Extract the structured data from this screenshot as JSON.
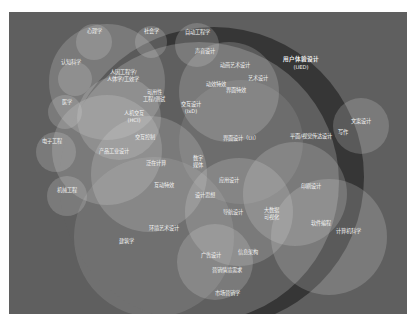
{
  "diagram": {
    "title": "",
    "type": "venn-bubble",
    "colors": {
      "background": "#5f5f5f",
      "page": "#ffffff",
      "bubble_fill": "#d9d9d9",
      "ring_dark": "#2f2f2f",
      "label": "#f2f2f2"
    },
    "ring": {
      "label_line1": "用户体验设计",
      "label_line2": "(UED)"
    },
    "bubbles": [
      {
        "id": "psychology",
        "label": "心理学"
      },
      {
        "id": "sociology",
        "label": "社会学"
      },
      {
        "id": "automation",
        "label": "自动工程学"
      },
      {
        "id": "cognitive",
        "label": "认知科学"
      },
      {
        "id": "ergonomics",
        "label": "人因工程学/人体学/工效学"
      },
      {
        "id": "medicine",
        "label": "医学"
      },
      {
        "id": "electronics",
        "label": "电子工程"
      },
      {
        "id": "industrial",
        "label": "产品工业设计"
      },
      {
        "id": "mechanical",
        "label": "机械工程"
      },
      {
        "id": "motion_art",
        "label": "动画艺术设计"
      },
      {
        "id": "copywriting",
        "label": "文案设计"
      },
      {
        "id": "architecture",
        "label": "建筑学"
      },
      {
        "id": "computer_science",
        "label": "计算机科学"
      },
      {
        "id": "market",
        "label": "市场营销学"
      }
    ],
    "labels": {
      "hci_line1": "人机交互",
      "hci_line2": "(HCI)",
      "usability_line1": "可用性",
      "usability_line2": "工程/测试",
      "ixd_line1": "交互设计",
      "ixd_line2": "(IxD)",
      "interaction_control": "交互控制",
      "sound_design": "声音设计",
      "motion_effects": "动效特效",
      "art_design": "艺术设计",
      "interface_effects": "界面特效",
      "ui_design": "界面设计（UI）",
      "graphic_visual": "平面/视觉传达设计",
      "writing": "写作",
      "ubiquitous": "泛在计算",
      "digital_media_1": "数字",
      "digital_media_2": "媒体",
      "interactive_effects": "互动特效",
      "app_design": "应用设计",
      "design_thinking": "设计思想",
      "navigation": "导航设计",
      "big_data_1": "大数据",
      "big_data_2": "可视化",
      "print_design": "印刷设计",
      "software_dev": "软件编程",
      "env_art": "环境艺术设计",
      "info_arch": "信息架构",
      "ad_design": "广告设计",
      "marketing_req": "营销情境需求"
    }
  }
}
